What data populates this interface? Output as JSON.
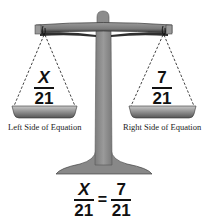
{
  "figure": {
    "left_pan": {
      "numerator": "X",
      "denominator": "21",
      "label": "Left Side of Equation"
    },
    "right_pan": {
      "numerator": "7",
      "denominator": "21",
      "label": "Right Side of Equation"
    },
    "equation": {
      "left_numerator": "X",
      "left_denominator": "21",
      "sign": "=",
      "right_numerator": "7",
      "right_denominator": "21"
    },
    "colors": {
      "scale_gray": "#8a8a8a",
      "scale_dark": "#3a3a3a",
      "text": "#111111"
    }
  }
}
